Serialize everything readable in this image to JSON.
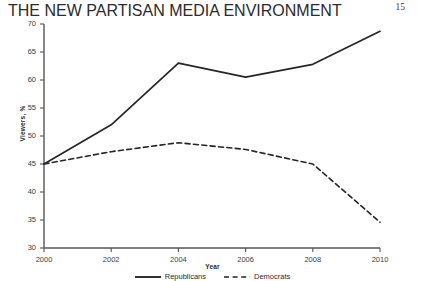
{
  "page": {
    "running_head": "THE NEW PARTISAN MEDIA ENVIRONMENT",
    "page_number": "15"
  },
  "chart_data": {
    "type": "line",
    "title": "",
    "xlabel": "Year",
    "ylabel": "Viewers, %",
    "x": [
      2000,
      2002,
      2004,
      2006,
      2008,
      2010
    ],
    "categories": [
      "2000",
      "2002",
      "2004",
      "2006",
      "2008",
      "2010"
    ],
    "xlim": [
      2000,
      2010
    ],
    "ylim": [
      30,
      70
    ],
    "yticks": [
      30,
      35,
      40,
      45,
      50,
      55,
      60,
      65,
      70
    ],
    "ytick_labels": [
      "30",
      "35",
      "40",
      "45",
      "50",
      "55",
      "60",
      "65",
      "70"
    ],
    "xticks": [
      2000,
      2002,
      2004,
      2006,
      2008,
      2010
    ],
    "xtick_labels": [
      "2000",
      "2002",
      "2004",
      "2006",
      "2008",
      "2010"
    ],
    "grid": false,
    "legend_position": "bottom",
    "series": [
      {
        "name": "Republicans",
        "style": "solid",
        "color": "#262626",
        "values": [
          45.0,
          52.0,
          63.0,
          60.5,
          62.8,
          68.7
        ]
      },
      {
        "name": "Democrats",
        "style": "dashed",
        "color": "#262626",
        "values": [
          45.0,
          47.2,
          48.8,
          47.6,
          45.0,
          34.6
        ]
      }
    ]
  }
}
